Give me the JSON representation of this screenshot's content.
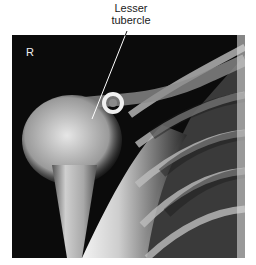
{
  "figure": {
    "image_type": "shoulder radiograph",
    "side_marker": "R",
    "annotations": [
      {
        "label_line1": "Lesser",
        "label_line2": "tubercle",
        "pointer_from": [
          127,
          31
        ],
        "pointer_to": [
          92,
          119
        ]
      }
    ],
    "colors": {
      "background": "#ffffff",
      "film_dark": "#0b0b0b",
      "bone_light": "#f2f2f2",
      "label_text": "#1a1a1a"
    }
  }
}
